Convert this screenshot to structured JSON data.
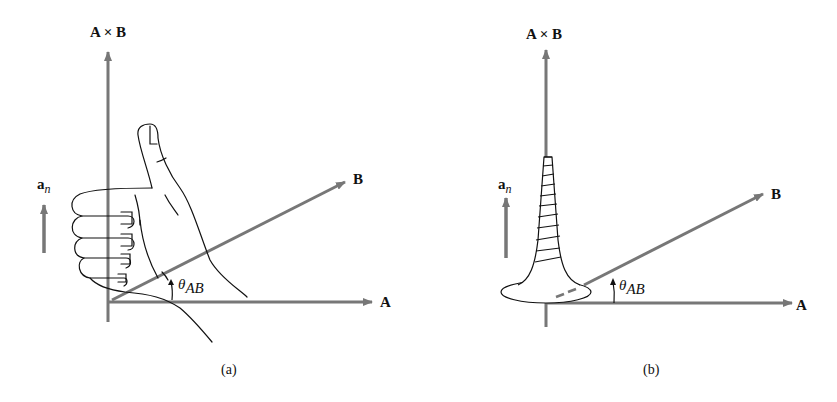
{
  "panels": [
    {
      "id": "a",
      "caption": "(a)",
      "axis_z_label": "A × B",
      "axis_x_label": "A",
      "vector_b_label": "B",
      "unit_vector_label": "a",
      "unit_vector_subscript": "n",
      "angle_label": "θ",
      "angle_subscript": "AB",
      "illustration": "right-hand-rule-thumb"
    },
    {
      "id": "b",
      "caption": "(b)",
      "axis_z_label": "A × B",
      "axis_x_label": "A",
      "vector_b_label": "B",
      "unit_vector_label": "a",
      "unit_vector_subscript": "n",
      "angle_label": "θ",
      "angle_subscript": "AB",
      "illustration": "right-hand-screw"
    }
  ],
  "colors": {
    "arrow": "#777777",
    "ink": "#111111",
    "background": "#ffffff"
  }
}
